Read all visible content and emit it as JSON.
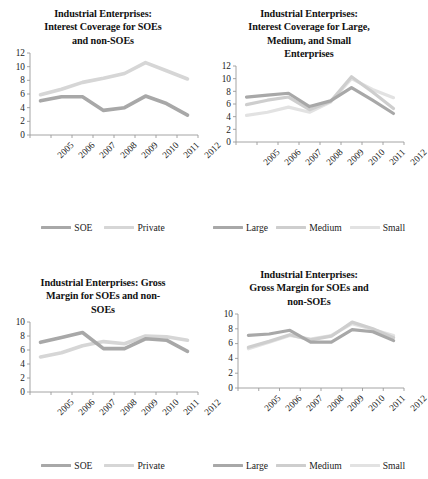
{
  "figure": {
    "panels": [
      {
        "id": "interest-coverage-soe-nonsoe",
        "title": "Industrial Enterprises: Interest Coverage for SOEs and non-SOEs",
        "title_lines": [
          "Industrial Enterprises:",
          "Interest Coverage for SOEs",
          "and non-SOEs"
        ],
        "chart_data": {
          "type": "line",
          "title": "Industrial Enterprises: Interest Coverage for SOEs and non-SOEs",
          "xlabel": "",
          "ylabel": "",
          "categories": [
            "2005",
            "2006",
            "2007",
            "2008",
            "2009",
            "2010",
            "2011",
            "2012"
          ],
          "ylim": [
            0,
            12
          ],
          "yticks": [
            0,
            2,
            4,
            6,
            8,
            10,
            12
          ],
          "ytick_labels": [
            "0",
            "2",
            "4",
            "6",
            "8",
            "10",
            "12"
          ],
          "grid": false,
          "legend_position": "bottom",
          "series": [
            {
              "name": "SOE",
              "color": "#a8a8a8",
              "values": [
                5.0,
                5.6,
                5.6,
                3.6,
                4.0,
                5.7,
                4.6,
                2.9
              ]
            },
            {
              "name": "Private",
              "color": "#d6d6d6",
              "values": [
                5.9,
                6.7,
                7.7,
                8.3,
                9.0,
                10.6,
                9.4,
                8.2
              ]
            }
          ]
        },
        "legend": [
          {
            "label": "SOE",
            "color": "#a8a8a8",
            "icon": "line-swatch-icon"
          },
          {
            "label": "Private",
            "color": "#d6d6d6",
            "icon": "line-swatch-icon"
          }
        ]
      },
      {
        "id": "interest-coverage-size",
        "title": "Industrial Enterprises: Interest Coverage for Large, Medium, and Small Enterprises",
        "title_lines": [
          "Industrial Enterprises:",
          "Interest Coverage for Large,",
          "Medium, and Small",
          "Enterprises"
        ],
        "chart_data": {
          "type": "line",
          "title": "Industrial Enterprises: Interest Coverage for Large, Medium, and Small Enterprises",
          "xlabel": "",
          "ylabel": "",
          "categories": [
            "2005",
            "2006",
            "2007",
            "2008",
            "2009",
            "2010",
            "2011",
            "2012"
          ],
          "ylim": [
            0,
            12
          ],
          "yticks": [
            0,
            2,
            4,
            6,
            8,
            10,
            12
          ],
          "ytick_labels": [
            "0",
            "2",
            "4",
            "6",
            "8",
            "10",
            "12"
          ],
          "grid": false,
          "legend_position": "bottom",
          "series": [
            {
              "name": "Large",
              "color": "#a8a8a8",
              "values": [
                7.1,
                7.4,
                7.7,
                5.6,
                6.5,
                8.6,
                6.6,
                4.5
              ]
            },
            {
              "name": "Medium",
              "color": "#cecece",
              "values": [
                5.9,
                6.6,
                7.1,
                5.1,
                6.4,
                10.3,
                7.9,
                5.3
              ]
            },
            {
              "name": "Small",
              "color": "#e2e2e2",
              "values": [
                4.2,
                4.7,
                5.5,
                4.7,
                6.3,
                10.0,
                8.3,
                7.0
              ]
            }
          ]
        },
        "legend": [
          {
            "label": "Large",
            "color": "#a8a8a8",
            "icon": "line-swatch-icon"
          },
          {
            "label": "Medium",
            "color": "#cecece",
            "icon": "line-swatch-icon"
          },
          {
            "label": "Small",
            "color": "#e2e2e2",
            "icon": "line-swatch-icon"
          }
        ]
      },
      {
        "id": "gross-margin-soe-nonsoe",
        "title": "Industrial Enterprises: Gross Margin for SOEs and non-SOEs",
        "title_lines": [
          "Industrial Enterprises: Gross",
          "Margin for SOEs and non-",
          "SOEs"
        ],
        "chart_data": {
          "type": "line",
          "title": "Industrial Enterprises: Gross Margin for SOEs and non-SOEs",
          "xlabel": "",
          "ylabel": "",
          "categories": [
            "2005",
            "2006",
            "2007",
            "2008",
            "2009",
            "2010",
            "2011",
            "2012"
          ],
          "ylim": [
            0,
            10
          ],
          "yticks": [
            0,
            2,
            4,
            6,
            8,
            10
          ],
          "ytick_labels": [
            "0",
            "2",
            "4",
            "6",
            "8",
            "10"
          ],
          "grid": false,
          "legend_position": "bottom",
          "series": [
            {
              "name": "SOE",
              "color": "#a8a8a8",
              "values": [
                7.1,
                7.8,
                8.5,
                6.2,
                6.2,
                7.6,
                7.4,
                5.8
              ]
            },
            {
              "name": "Private",
              "color": "#d6d6d6",
              "values": [
                5.0,
                5.6,
                6.6,
                7.2,
                6.9,
                8.0,
                7.9,
                7.4
              ]
            }
          ]
        },
        "legend": [
          {
            "label": "SOE",
            "color": "#a8a8a8",
            "icon": "line-swatch-icon"
          },
          {
            "label": "Private",
            "color": "#d6d6d6",
            "icon": "line-swatch-icon"
          }
        ]
      },
      {
        "id": "gross-margin-size",
        "title": "Industrial Enterprises: Gross Margin for SOEs and non-SOEs",
        "title_lines": [
          "Industrial Enterprises:",
          "Gross Margin for SOEs and",
          "non-SOEs"
        ],
        "chart_data": {
          "type": "line",
          "title": "Industrial Enterprises: Gross Margin for SOEs and non-SOEs",
          "xlabel": "",
          "ylabel": "",
          "categories": [
            "2005",
            "2006",
            "2007",
            "2008",
            "2009",
            "2010",
            "2011",
            "2012"
          ],
          "ylim": [
            0,
            10
          ],
          "yticks": [
            0,
            2,
            4,
            6,
            8,
            10
          ],
          "ytick_labels": [
            "0",
            "2",
            "4",
            "6",
            "8",
            "10"
          ],
          "grid": false,
          "legend_position": "bottom",
          "series": [
            {
              "name": "Large",
              "color": "#a8a8a8",
              "values": [
                7.1,
                7.3,
                7.8,
                6.2,
                6.2,
                7.9,
                7.6,
                6.4
              ]
            },
            {
              "name": "Medium",
              "color": "#cecece",
              "values": [
                5.5,
                6.3,
                7.2,
                6.5,
                7.0,
                8.9,
                8.0,
                6.8
              ]
            },
            {
              "name": "Small",
              "color": "#e2e2e2",
              "values": [
                5.3,
                6.2,
                7.1,
                6.6,
                7.1,
                8.7,
                7.9,
                7.1
              ]
            }
          ]
        },
        "legend": [
          {
            "label": "Large",
            "color": "#a8a8a8",
            "icon": "line-swatch-icon"
          },
          {
            "label": "Medium",
            "color": "#cecece",
            "icon": "line-swatch-icon"
          },
          {
            "label": "Small",
            "color": "#e2e2e2",
            "icon": "line-swatch-icon"
          }
        ]
      }
    ],
    "colors": {
      "axis": "#9a9a9a",
      "text": "#1a1a1a",
      "background": "#ffffff",
      "series_dark": "#a8a8a8",
      "series_mid": "#cecece",
      "series_light": "#e2e2e2"
    }
  }
}
